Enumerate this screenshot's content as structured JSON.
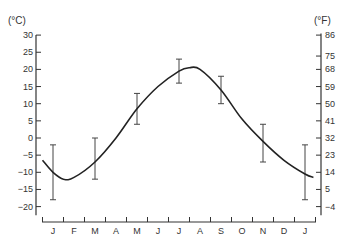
{
  "chart_data": {
    "type": "line",
    "title": "",
    "xlabel": "",
    "ylabel": "(°C)",
    "y2label": "(°F)",
    "months": [
      "J",
      "F",
      "M",
      "A",
      "M",
      "J",
      "J",
      "A",
      "S",
      "O",
      "N",
      "D",
      "J"
    ],
    "left_ticks": [
      30,
      25,
      20,
      15,
      10,
      5,
      0,
      -5,
      -10,
      -15,
      -20
    ],
    "right_ticks": [
      86,
      75,
      68,
      59,
      50,
      41,
      32,
      23,
      14,
      5,
      -4
    ],
    "ylim": [
      -22,
      31
    ],
    "grid": false,
    "series": [
      {
        "name": "Mean temperature curve (°C)",
        "points": [
          {
            "month_index": -0.5,
            "value": -6.5
          },
          {
            "month_index": 0.0,
            "value": -10
          },
          {
            "month_index": 0.5,
            "value": -12
          },
          {
            "month_index": 1.0,
            "value": -11.5
          },
          {
            "month_index": 2.0,
            "value": -7
          },
          {
            "month_index": 3.0,
            "value": 0
          },
          {
            "month_index": 4.0,
            "value": 8.5
          },
          {
            "month_index": 5.0,
            "value": 15
          },
          {
            "month_index": 6.0,
            "value": 19.5
          },
          {
            "month_index": 6.5,
            "value": 20.5
          },
          {
            "month_index": 7.0,
            "value": 20
          },
          {
            "month_index": 8.0,
            "value": 14
          },
          {
            "month_index": 9.0,
            "value": 5.5
          },
          {
            "month_index": 10.0,
            "value": -1
          },
          {
            "month_index": 11.0,
            "value": -6.5
          },
          {
            "month_index": 12.0,
            "value": -10.5
          },
          {
            "month_index": 12.4,
            "value": -11.5
          }
        ]
      }
    ],
    "error_bars": [
      {
        "month": "J",
        "month_index": 0,
        "high": -2,
        "low": -18
      },
      {
        "month": "M",
        "month_index": 2,
        "high": 0,
        "low": -12
      },
      {
        "month": "M",
        "month_index": 4,
        "high": 13,
        "low": 4
      },
      {
        "month": "J",
        "month_index": 6,
        "high": 23,
        "low": 16
      },
      {
        "month": "S",
        "month_index": 8,
        "high": 18,
        "low": 10
      },
      {
        "month": "N",
        "month_index": 10,
        "high": 4,
        "low": -7
      },
      {
        "month": "J",
        "month_index": 12,
        "high": -2,
        "low": -18
      }
    ]
  }
}
